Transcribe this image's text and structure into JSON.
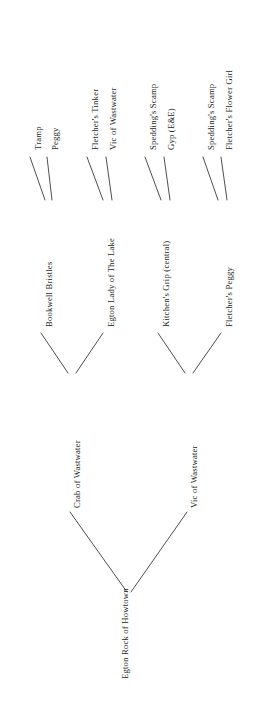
{
  "diagram": {
    "type": "pedigree-tree",
    "orientation": "rotated-90-ccw",
    "line_color": "#3a3a3a",
    "text_color": "#231f20",
    "background": "#ffffff",
    "generations": 4
  },
  "nodes": {
    "root": {
      "label": "Egton Rock of Howtown"
    },
    "gen2": [
      {
        "label": "Crab of Wastwater"
      },
      {
        "label": "Vic of Wastwater"
      }
    ],
    "gen3": [
      {
        "label": "Bookwell Bristles"
      },
      {
        "label": "Egton Lady of The Lake"
      },
      {
        "label": "Kitchen's Grip (central)"
      },
      {
        "label": "Fletcher's Peggy"
      }
    ],
    "gen4": [
      {
        "label": "Tramp"
      },
      {
        "label": "Peggy"
      },
      {
        "label": "Fletcher's Tinker"
      },
      {
        "label": "Vic of Wastwater"
      },
      {
        "label": "Spedding's Scamp"
      },
      {
        "label": "Gyp (E&E)"
      },
      {
        "label": "Spedding's Scamp"
      },
      {
        "label": "Fletcher's Flower Girl"
      }
    ]
  },
  "edges": {
    "gen4_to_gen3": [
      {
        "x1": 30,
        "y1": 157,
        "x2": 45,
        "y2": 200
      },
      {
        "x1": 52,
        "y1": 200,
        "x2": 47,
        "y2": 157
      },
      {
        "x1": 87,
        "y1": 157,
        "x2": 103,
        "y2": 200
      },
      {
        "x1": 112,
        "y1": 200,
        "x2": 106,
        "y2": 157
      },
      {
        "x1": 145,
        "y1": 157,
        "x2": 161,
        "y2": 200
      },
      {
        "x1": 170,
        "y1": 200,
        "x2": 164,
        "y2": 157
      },
      {
        "x1": 203,
        "y1": 157,
        "x2": 218,
        "y2": 200
      },
      {
        "x1": 227,
        "y1": 200,
        "x2": 221,
        "y2": 157
      }
    ],
    "gen3_to_gen2": [
      {
        "x1": 41,
        "y1": 333,
        "x2": 68,
        "y2": 373
      },
      {
        "x1": 103,
        "y1": 333,
        "x2": 76,
        "y2": 373
      },
      {
        "x1": 158,
        "y1": 333,
        "x2": 185,
        "y2": 373
      },
      {
        "x1": 221,
        "y1": 333,
        "x2": 193,
        "y2": 373
      }
    ],
    "gen2_to_root": [
      {
        "x1": 70,
        "y1": 512,
        "x2": 127,
        "y2": 592
      },
      {
        "x1": 187,
        "y1": 512,
        "x2": 131,
        "y2": 592
      }
    ]
  }
}
